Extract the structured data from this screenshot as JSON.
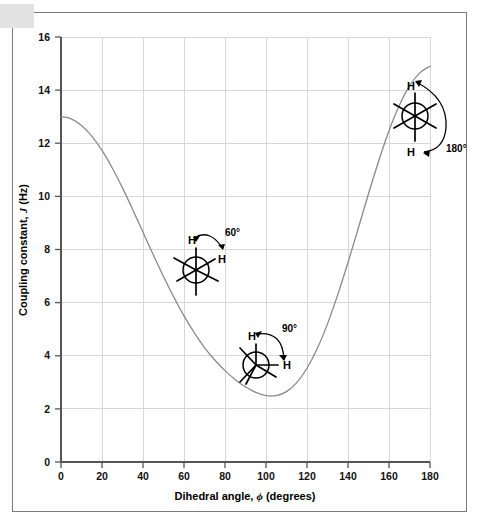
{
  "figure": {
    "background_color": "#ffffff",
    "frame_color": "#7a7a7a",
    "corner_tab_color": "#e2e2e2",
    "grid_color": "#d6d6d6",
    "axis_color": "#555555",
    "curve_color": "#8a8a8a",
    "annotation_color": "#000000"
  },
  "chart_data": {
    "type": "line",
    "title": "",
    "xlabel_parts": {
      "pre": "Dihedral angle, ",
      "symbol": "ϕ",
      "post": " (degrees)"
    },
    "xlabel": "Dihedral angle, ϕ (degrees)",
    "ylabel_parts": {
      "pre": "Coupling constant, ",
      "symbol": "J",
      "post": " (Hz)"
    },
    "ylabel": "Coupling constant, J (Hz)",
    "xlim": [
      0,
      180
    ],
    "ylim": [
      0,
      16
    ],
    "xticks": [
      0,
      20,
      40,
      60,
      80,
      100,
      120,
      140,
      160,
      180
    ],
    "yticks": [
      0,
      2,
      4,
      6,
      8,
      10,
      12,
      14,
      16
    ],
    "xtick_labels": [
      "0",
      "20",
      "40",
      "60",
      "80",
      "100",
      "120",
      "140",
      "160",
      "180"
    ],
    "ytick_labels": [
      "0",
      "2",
      "4",
      "6",
      "8",
      "10",
      "12",
      "14",
      "16"
    ],
    "grid": true,
    "legend": null,
    "series": [
      {
        "name": "Karplus curve",
        "color": "#8a8a8a",
        "x": [
          0,
          5,
          10,
          15,
          20,
          25,
          30,
          35,
          40,
          45,
          50,
          55,
          60,
          65,
          70,
          75,
          80,
          85,
          88,
          90,
          95,
          100,
          105,
          110,
          115,
          120,
          125,
          130,
          135,
          140,
          145,
          150,
          155,
          160,
          165,
          170,
          175,
          180
        ],
        "y": [
          13.0,
          12.92,
          12.67,
          12.27,
          11.73,
          11.07,
          10.32,
          9.5,
          8.65,
          7.8,
          6.98,
          6.21,
          5.5,
          4.87,
          4.31,
          3.84,
          3.44,
          3.1,
          2.93,
          2.83,
          2.62,
          2.5,
          2.5,
          2.65,
          2.99,
          3.53,
          4.27,
          5.2,
          6.3,
          7.51,
          8.8,
          10.1,
          11.34,
          12.47,
          13.42,
          14.16,
          14.65,
          14.9
        ]
      }
    ],
    "annotations": [
      {
        "id": "newman-60",
        "label": "60°",
        "dihedral_deg": 60,
        "data_x": 62,
        "data_y": 7.1,
        "h_front_label": "H",
        "h_back_label": "H"
      },
      {
        "id": "newman-90",
        "label": "90°",
        "dihedral_deg": 90,
        "data_x": 93,
        "data_y": 3.6,
        "h_front_label": "H",
        "h_back_label": "H"
      },
      {
        "id": "newman-180",
        "label": "180°",
        "dihedral_deg": 180,
        "data_x": 168,
        "data_y": 13.1,
        "h_front_label": "H",
        "h_back_label": "H"
      }
    ]
  }
}
